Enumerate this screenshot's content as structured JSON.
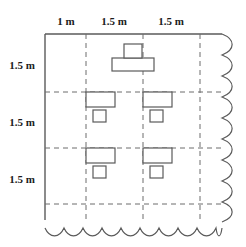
{
  "diagram": {
    "stroke_color": "#5a5a5a",
    "grid_color": "#6d6d6d",
    "label_color": "#1b1b1b",
    "fill_color": "#ffffff"
  },
  "top_dimensions": [
    {
      "label": "1 m",
      "x": 66,
      "y": 22
    },
    {
      "label": "1.5 m",
      "x": 114,
      "y": 22
    },
    {
      "label": "1.5 m",
      "x": 171,
      "y": 22
    }
  ],
  "left_dimensions": [
    {
      "label": "1.5 m",
      "x": 22,
      "y": 66
    },
    {
      "label": "1.5 m",
      "x": 22,
      "y": 123
    },
    {
      "label": "1.5 m",
      "x": 22,
      "y": 180
    }
  ],
  "walls": {
    "left": {
      "x1": 45,
      "y1": 34,
      "x2": 45,
      "y2": 220
    },
    "top": {
      "x1": 45,
      "y1": 34,
      "x2": 222,
      "y2": 34
    }
  },
  "grid": {
    "vertical_x": [
      86,
      143,
      200
    ],
    "horizontal_y": [
      92,
      148,
      204
    ],
    "v_top": 34,
    "v_bottom": 222,
    "h_left": 45,
    "h_right": 222
  },
  "break_lines": {
    "right": {
      "x": 222,
      "y_from": 34,
      "y_to": 222,
      "amplitude": 9,
      "period": 21
    },
    "bottom": {
      "y": 228,
      "x_from": 45,
      "x_to": 222,
      "amplitude": 7,
      "period": 19
    }
  },
  "furniture": [
    {
      "name": "teacher-desk",
      "kind": "teacher",
      "desk": {
        "x": 112,
        "y": 58,
        "w": 42,
        "h": 13
      },
      "chair": {
        "x": 124,
        "y": 44,
        "w": 18,
        "h": 14
      }
    },
    {
      "name": "student-desk-row1-col1",
      "kind": "student",
      "desk": {
        "x": 86,
        "y": 92,
        "w": 29,
        "h": 15
      },
      "chair": {
        "x": 93,
        "y": 110,
        "w": 13,
        "h": 12
      }
    },
    {
      "name": "student-desk-row1-col2",
      "kind": "student",
      "desk": {
        "x": 143,
        "y": 92,
        "w": 29,
        "h": 15
      },
      "chair": {
        "x": 150,
        "y": 110,
        "w": 13,
        "h": 12
      }
    },
    {
      "name": "student-desk-row2-col1",
      "kind": "student",
      "desk": {
        "x": 86,
        "y": 148,
        "w": 29,
        "h": 15
      },
      "chair": {
        "x": 93,
        "y": 166,
        "w": 13,
        "h": 12
      }
    },
    {
      "name": "student-desk-row2-col2",
      "kind": "student",
      "desk": {
        "x": 143,
        "y": 148,
        "w": 29,
        "h": 15
      },
      "chair": {
        "x": 150,
        "y": 166,
        "w": 13,
        "h": 12
      }
    }
  ]
}
